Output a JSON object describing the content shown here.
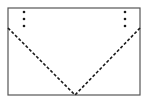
{
  "figure": {
    "canvas": {
      "width": 148,
      "height": 104,
      "background": "#ffffff"
    },
    "colors": {
      "outline": "#555555",
      "dashed_line": "#1a1a1a",
      "dot": "#1a1a1a",
      "background": "#ffffff"
    },
    "rectangle": {
      "name": "envelope-outline",
      "x": 8,
      "y": 8,
      "width": 132,
      "height": 87,
      "stroke_width": 1.2,
      "fill": "none"
    },
    "fold_lines": [
      {
        "name": "left-fold-line",
        "x1": 8,
        "y1": 28,
        "x2": 75,
        "y2": 95,
        "style": "dashed",
        "dash_pattern": "3 2",
        "stroke_width": 1.6
      },
      {
        "name": "right-fold-line",
        "x1": 140,
        "y1": 28,
        "x2": 75,
        "y2": 95,
        "style": "dashed",
        "dash_pattern": "3 2",
        "stroke_width": 1.6
      }
    ],
    "apex": {
      "x": 75,
      "y": 95
    },
    "dot_columns": [
      {
        "name": "left-dot-column",
        "x": 24,
        "radius": 1.3,
        "dots_y": [
          12,
          19,
          26
        ],
        "count": 3
      },
      {
        "name": "right-dot-column",
        "x": 125,
        "radius": 1.3,
        "dots_y": [
          12,
          19,
          26
        ],
        "count": 3
      }
    ]
  }
}
